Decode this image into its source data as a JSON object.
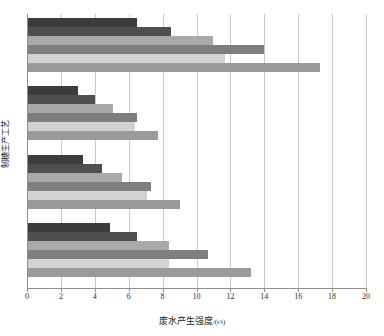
{
  "chart_data": {
    "type": "bar",
    "orientation": "horizontal",
    "title": "",
    "xlabel": "废水产生强度/(t/t)",
    "ylabel": "制糖生产工艺",
    "xlim": [
      0,
      20
    ],
    "xticks": [
      0,
      2,
      4,
      6,
      8,
      10,
      12,
      14,
      16,
      18,
      20
    ],
    "grid": "vertical",
    "legend": "none",
    "categories": [
      "工艺一",
      "工艺二",
      "工艺三",
      "工艺四"
    ],
    "series": [
      {
        "name": "系列1",
        "color": "#3c3c3c",
        "values": [
          6.5,
          3.0,
          3.3,
          4.9
        ]
      },
      {
        "name": "系列2",
        "color": "#4f4f4f",
        "values": [
          8.5,
          4.0,
          4.4,
          6.5
        ]
      },
      {
        "name": "系列3",
        "color": "#a9a9a9",
        "values": [
          11.0,
          5.1,
          5.6,
          8.4
        ]
      },
      {
        "name": "系列4",
        "color": "#7e7e7e",
        "values": [
          14.0,
          6.5,
          7.3,
          10.7
        ]
      },
      {
        "name": "系列5",
        "color": "#d2d2d2",
        "values": [
          11.7,
          6.4,
          7.1,
          8.4
        ]
      },
      {
        "name": "系列6",
        "color": "#9a9a9a",
        "values": [
          17.3,
          7.7,
          9.0,
          13.2
        ]
      }
    ]
  },
  "axis": {
    "tick_labels": [
      "0",
      "2",
      "4",
      "6",
      "8",
      "10",
      "12",
      "14",
      "16",
      "18",
      "20"
    ],
    "x_title_main": "废水产生强度",
    "x_title_unit": "/(t/t)",
    "y_title": "制糖生产工艺"
  },
  "colors": {
    "grid": "#c9c9c9",
    "axis": "#8f8f8f",
    "text": "#1a1a1a",
    "background": "#ffffff"
  }
}
